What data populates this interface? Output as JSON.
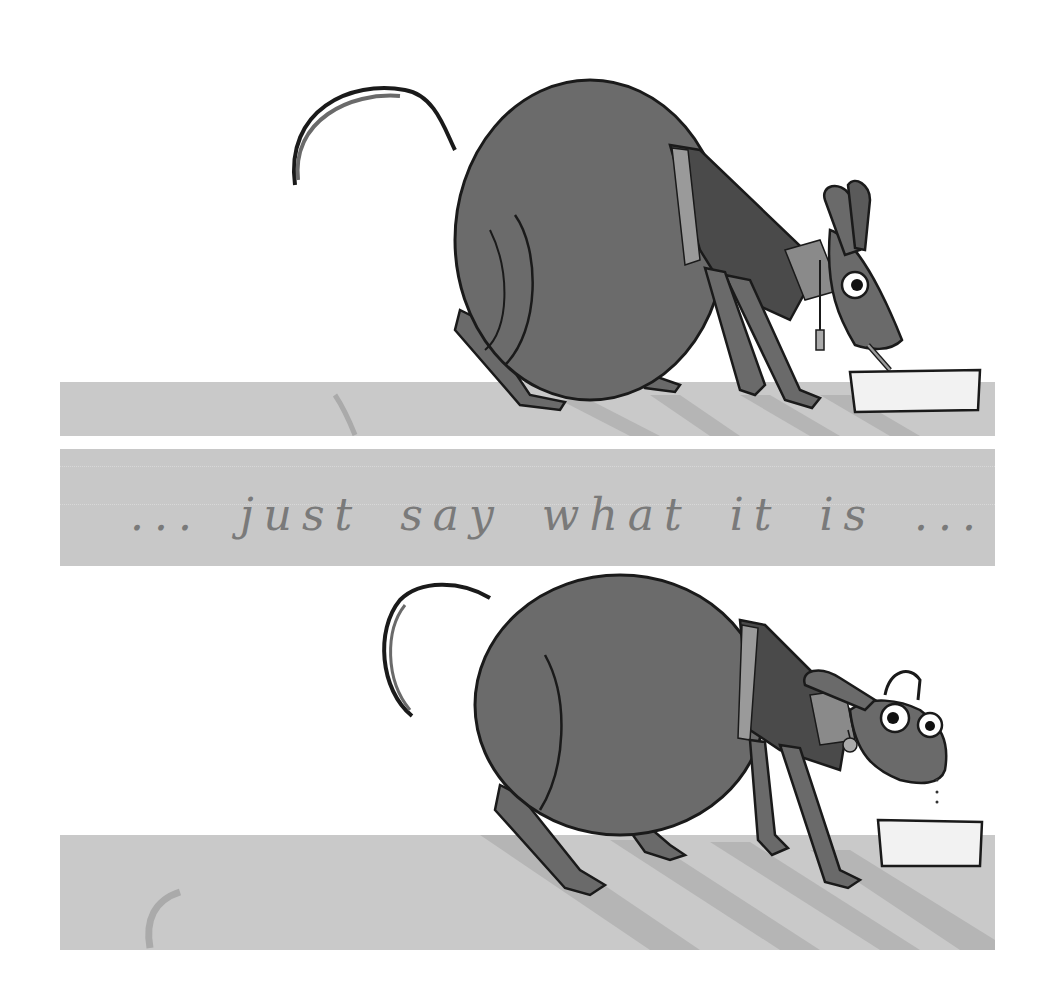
{
  "caption": {
    "text": "... just say what it is ..."
  },
  "panels": [
    {
      "name": "top-panel",
      "description": "round dog in sweater drinking from a bowl"
    },
    {
      "name": "bottom-panel",
      "description": "round dog in sweater looking up from bowl with dripping mouth"
    }
  ],
  "colors": {
    "floor": "#c9c9c9",
    "body": "#6a6a6a",
    "sweater_dark": "#4a4a4a",
    "stripe": "#9a9a9a",
    "outline": "#1a1a1a",
    "bowl": "#f2f2f2",
    "caption_band": "#c8c8c8",
    "caption_text": "#7a7a7a"
  }
}
